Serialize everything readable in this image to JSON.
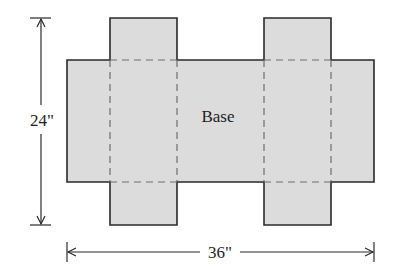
{
  "diagram": {
    "type": "box-net",
    "base_label": "Base",
    "height_label": "24\"",
    "width_label": "36\"",
    "colors": {
      "fill": "#dcdcdc",
      "outline": "#2a2a2a",
      "fold_line": "#6e6e6e",
      "dimension_line": "#2a2a2a",
      "text": "#1e1e1e"
    },
    "dimensions": {
      "height_inches": 24,
      "width_inches": 36
    },
    "parts": [
      "base",
      "top-left-flap",
      "top-right-flap",
      "bottom-left-flap",
      "bottom-right-flap"
    ]
  }
}
